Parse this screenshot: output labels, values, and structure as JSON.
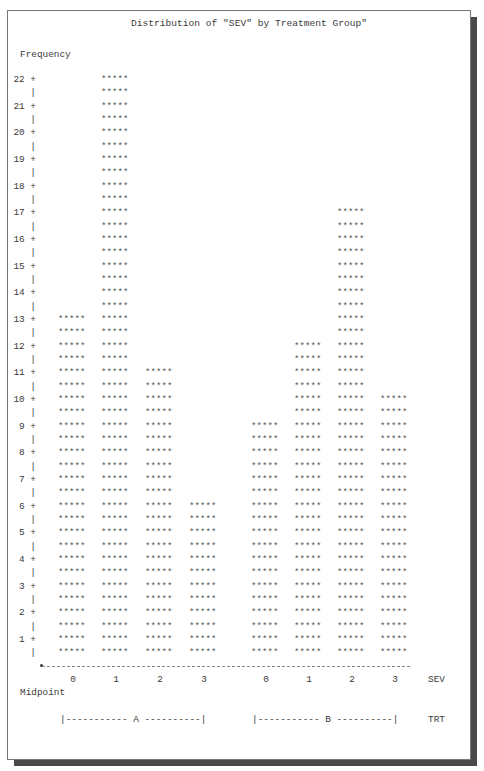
{
  "chart_data": {
    "type": "bar",
    "title": "Distribution of \"SEV\" by Treatment Group\"",
    "ylabel": "Frequency",
    "xlabel": "Midpoint",
    "x_variable_label": "SEV",
    "group_variable_label": "TRT",
    "ylim": [
      0,
      22
    ],
    "yticks": [
      1,
      2,
      3,
      4,
      5,
      6,
      7,
      8,
      9,
      10,
      11,
      12,
      13,
      14,
      15,
      16,
      17,
      18,
      19,
      20,
      21,
      22
    ],
    "bar_symbol": "*****",
    "categories": [
      "0",
      "1",
      "2",
      "3"
    ],
    "groups": [
      {
        "name": "A",
        "categories": [
          "0",
          "1",
          "2",
          "3"
        ],
        "values": [
          13,
          22,
          11,
          6
        ]
      },
      {
        "name": "B",
        "categories": [
          "0",
          "1",
          "2",
          "3"
        ],
        "values": [
          9,
          12,
          17,
          10
        ]
      }
    ],
    "series": [
      {
        "name": "A",
        "values": [
          13,
          22,
          11,
          6
        ]
      },
      {
        "name": "B",
        "values": [
          9,
          12,
          17,
          10
        ]
      }
    ],
    "grid": false,
    "legend": "none"
  },
  "labels": {
    "title": "Distribution of \"SEV\" by Treatment Group\"",
    "frequency": "Frequency",
    "midpoint": "Midpoint",
    "sev": "SEV",
    "trt": "TRT",
    "group_a_bracket": "|----------- A ----------|",
    "group_b_bracket": "|----------- B ----------|"
  }
}
